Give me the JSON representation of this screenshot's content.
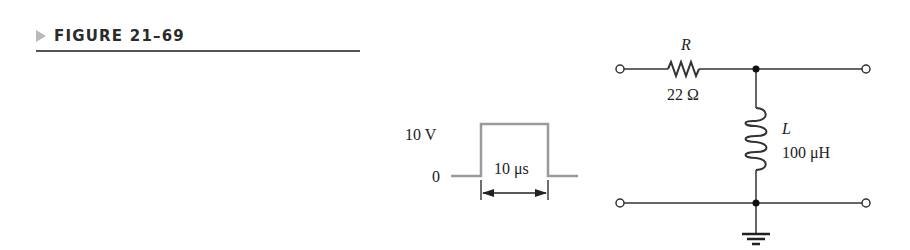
{
  "figure": {
    "title": "FIGURE 21–69"
  },
  "pulse": {
    "high_label": "10 V",
    "low_label": "0",
    "width_label": "10 μs",
    "amplitude_volts": 10,
    "width_microseconds": 10
  },
  "circuit": {
    "resistor": {
      "symbol": "R",
      "value": "22 Ω"
    },
    "inductor": {
      "symbol": "L",
      "value": "100 μH"
    }
  },
  "colors": {
    "pulse_line": "#9a9a9a",
    "wire": "#333333"
  }
}
